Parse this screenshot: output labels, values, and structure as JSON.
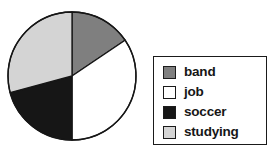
{
  "chart_data": {
    "type": "pie",
    "title": "",
    "subtitle": "",
    "xlabel": "",
    "ylabel": "",
    "grid": false,
    "legend_position": "right",
    "start_angle_deg": 0,
    "direction": "clockwise",
    "categories": [
      "band",
      "job",
      "soccer",
      "studying"
    ],
    "values": [
      15.5,
      34.5,
      21,
      29
    ],
    "value_unit": "percent",
    "slice_angles_deg": [
      56,
      124,
      75,
      105
    ],
    "slice_boundaries_deg": [
      0,
      56,
      180,
      255,
      360
    ],
    "colors": [
      "#7f7f7f",
      "#ffffff",
      "#161616",
      "#d4d4d4"
    ],
    "slice_edge_color": "#161616",
    "series": [
      {
        "name": "activities",
        "values": [
          15.5,
          34.5,
          21,
          29
        ]
      }
    ]
  },
  "chart": {
    "pie": {
      "center_x": 66,
      "center_y": 66,
      "radius": 64,
      "outline_color": "#161616",
      "slices": [
        {
          "name": "band",
          "color": "#7f7f7f",
          "start": 0,
          "end": 56
        },
        {
          "name": "job",
          "color": "#ffffff",
          "start": 56,
          "end": 180
        },
        {
          "name": "soccer",
          "color": "#161616",
          "start": 180,
          "end": 255
        },
        {
          "name": "studying",
          "color": "#d4d4d4",
          "start": 255,
          "end": 360
        }
      ]
    }
  },
  "legend": {
    "border_color": "#1a1a1a",
    "background": "#ffffff",
    "items": [
      {
        "label": "band",
        "color": "#7f7f7f"
      },
      {
        "label": "job",
        "color": "#ffffff"
      },
      {
        "label": "soccer",
        "color": "#161616"
      },
      {
        "label": "studying",
        "color": "#d4d4d4"
      }
    ]
  }
}
